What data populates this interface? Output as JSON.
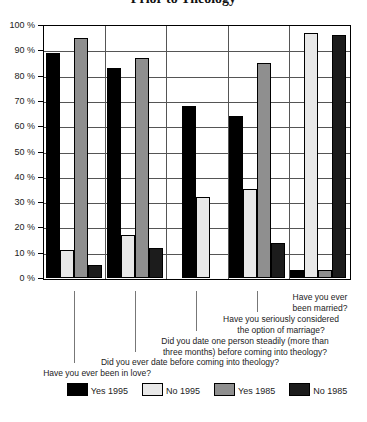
{
  "title": "Prior to Theology",
  "chart_data": {
    "type": "bar",
    "title": "Prior to Theology",
    "xlabel": "",
    "ylabel": "",
    "ylim": [
      0,
      100
    ],
    "ytick_step": 10,
    "grid": true,
    "legend_position": "bottom",
    "ytick_labels": [
      "100 %",
      "90 %",
      "80 %",
      "70 %",
      "60 %",
      "50 %",
      "40 %",
      "30 %",
      "20 %",
      "10 %",
      "0 %"
    ],
    "categories": [
      "Have you ever been in love?",
      "Did you ever date before coming into theology?",
      "Did you date one person steadily (more than three months) before coming into theology?",
      "Have you seriously considered the option of marriage?",
      "Have you ever been married?"
    ],
    "category_label_lines": [
      [
        "Have you ever been in love?"
      ],
      [
        "Did you ever date before coming into theology?"
      ],
      [
        "Did you date one person steadily (more than",
        "three months) before coming into theology?"
      ],
      [
        "Have you seriously considered",
        "the option of marriage?"
      ],
      [
        "Have you ever",
        "been married?"
      ]
    ],
    "series": [
      {
        "name": "Yes 1995",
        "color": "#000000",
        "values": [
          89,
          83,
          68,
          64,
          3
        ]
      },
      {
        "name": "No 1995",
        "color": "#e8e8e8",
        "values": [
          11,
          17,
          32,
          35,
          97
        ]
      },
      {
        "name": "Yes 1985",
        "color": "#8f8f8f",
        "values": [
          95,
          87,
          null,
          85,
          3
        ]
      },
      {
        "name": "No 1985",
        "color": "#1c1c1c",
        "values": [
          5,
          12,
          null,
          14,
          96
        ]
      }
    ]
  }
}
